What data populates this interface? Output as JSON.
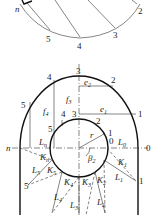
{
  "top_view": {
    "point_labels": [
      "n",
      "2",
      "3",
      "4",
      "5"
    ]
  },
  "main_view": {
    "outer_points": [
      "0",
      "1",
      "2",
      "3",
      "4",
      "5",
      "n"
    ],
    "inner_points": [
      "0",
      "1",
      "2",
      "3",
      "4",
      "5"
    ],
    "dims": {
      "e1": "e",
      "e1_sub": "1",
      "e2": "e",
      "e2_sub": "2",
      "f3": "f",
      "f3_sub": "3",
      "f4": "f",
      "f4_sub": "4",
      "Ln": "L",
      "Ln_sub": "n",
      "L0": "L",
      "L0_sub": "0",
      "r": "r",
      "beta2": "β",
      "beta2_sub": "2"
    },
    "triangles": {
      "K1": "K",
      "K1_sub": "1",
      "L1": "L",
      "L1_sub": "1",
      "K2": "K",
      "K2_sub": "2",
      "L2": "L",
      "L2_sub": "2",
      "K3": "K",
      "K3_sub": "3",
      "L3": "L",
      "L3_sub": "3",
      "K4": "K",
      "K4_sub": "4",
      "L4": "L",
      "L4_sub": "4",
      "K5": "K",
      "K5_sub": "5",
      "L5": "L",
      "L5_sub": "5",
      "Kn": "K",
      "Kn_sub": "n"
    }
  }
}
